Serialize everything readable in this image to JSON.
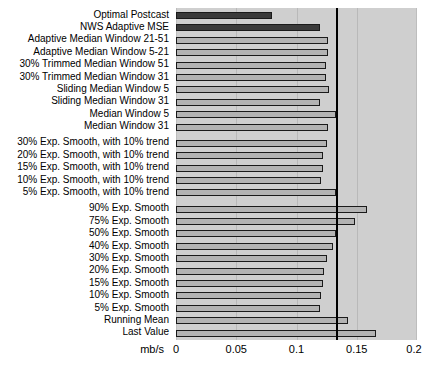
{
  "chart_data": {
    "type": "bar",
    "orientation": "horizontal",
    "title": "",
    "xlabel": "mb/s",
    "ylabel": "",
    "xlim": [
      0,
      0.2
    ],
    "ylim": null,
    "grid": true,
    "legend": null,
    "xticks": [
      "0",
      "0.05",
      "0.1",
      "0.15",
      "0.2"
    ],
    "xtick_values": [
      0,
      0.05,
      0.1,
      0.15,
      0.2
    ],
    "reference_line": {
      "label": "",
      "value": 0.133,
      "color": "#000000"
    },
    "colors": {
      "highlight_bar": "#3a3a3a",
      "normal_bar": "#b3b3b3",
      "bar_edge": "#1a1a1a",
      "plot_background": "#cfcfcf",
      "grid": "#b9b9b9",
      "text": "#000000"
    },
    "categories": [
      "Optimal Postcast",
      "NWS Adaptive MSE",
      "Adaptive Median Window 21-51",
      "Adaptive Median Window 5-21",
      "30% Trimmed Median Window 51",
      "30% Trimmed Median Window 31",
      "Sliding Median Window 5",
      "Sliding Median Window 31",
      "Median Window 5",
      "Median Window 31",
      "30% Exp. Smooth, with 10% trend",
      "20% Exp. Smooth, with 10% trend",
      "15% Exp. Smooth, with 10% trend",
      "10% Exp. Smooth, with 10% trend",
      "5% Exp. Smooth, with 10% trend",
      "90% Exp. Smooth",
      "75% Exp. Smooth",
      "50% Exp. Smooth",
      "40% Exp. Smooth",
      "30% Exp. Smooth",
      "20% Exp. Smooth",
      "15% Exp. Smooth",
      "10% Exp. Smooth",
      "5% Exp. Smooth",
      "Running Mean",
      "Last Value"
    ],
    "values": [
      0.0797,
      0.1195,
      0.1265,
      0.1265,
      0.1243,
      0.1243,
      0.127,
      0.1199,
      0.133,
      0.1265,
      0.1256,
      0.1222,
      0.1218,
      0.1201,
      0.133,
      0.1586,
      0.1482,
      0.133,
      0.1304,
      0.1252,
      0.1227,
      0.1218,
      0.1205,
      0.1192,
      0.1425,
      0.1663
    ],
    "highlighted": [
      true,
      true,
      false,
      false,
      false,
      false,
      false,
      false,
      false,
      false,
      false,
      false,
      false,
      false,
      false,
      false,
      false,
      false,
      false,
      false,
      false,
      false,
      false,
      false,
      false,
      false
    ],
    "row_gaps_after": [
      9,
      14
    ]
  }
}
